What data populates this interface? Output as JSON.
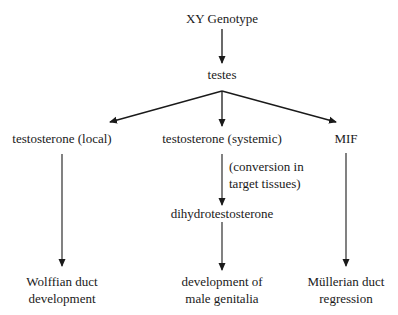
{
  "diagram": {
    "type": "flowchart",
    "nodes": {
      "root": {
        "label": "XY Genotype"
      },
      "testes": {
        "label": "testes"
      },
      "testosterone_local": {
        "label": "testosterone (local)"
      },
      "testosterone_systemic": {
        "label": "testosterone (systemic)"
      },
      "mif": {
        "label": "MIF"
      },
      "dht": {
        "label": "dihydrotestosterone"
      },
      "wolffian": {
        "line1": "Wolffian duct",
        "line2": "development"
      },
      "genitalia": {
        "line1": "development of",
        "line2": "male genitalia"
      },
      "mullerian": {
        "line1": "Müllerian duct",
        "line2": "regression"
      }
    },
    "edge_labels": {
      "conversion": {
        "line1": "(conversion in",
        "line2": "target tissues)"
      }
    },
    "edges": [
      {
        "from": "XY Genotype",
        "to": "testes"
      },
      {
        "from": "testes",
        "to": "testosterone (local)"
      },
      {
        "from": "testes",
        "to": "testosterone (systemic)"
      },
      {
        "from": "testes",
        "to": "MIF"
      },
      {
        "from": "testosterone (local)",
        "to": "Wolffian duct development"
      },
      {
        "from": "testosterone (systemic)",
        "to": "dihydrotestosterone",
        "label": "(conversion in target tissues)"
      },
      {
        "from": "dihydrotestosterone",
        "to": "development of male genitalia"
      },
      {
        "from": "MIF",
        "to": "Müllerian duct regression"
      }
    ],
    "colors": {
      "line": "#1a1a1a",
      "text": "#1a1a1a",
      "background": "#ffffff"
    }
  }
}
